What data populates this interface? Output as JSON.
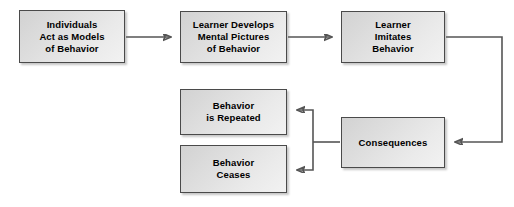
{
  "diagram": {
    "type": "flowchart",
    "background_color": "#ffffff",
    "box_fill_color": "#e2e2e2",
    "box_border_color": "#4a4a4a",
    "connector_color": "#555555",
    "text_color": "#000000",
    "nodes": [
      {
        "id": "individuals-act-as-models",
        "label": "Individuals\nAct as Models\nof Behavior",
        "x": 19,
        "y": 10,
        "w": 106,
        "h": 53
      },
      {
        "id": "learner-develops-mental-pictures",
        "label": "Learner Develops\nMental Pictures\nof Behavior",
        "x": 180,
        "y": 11,
        "w": 107,
        "h": 52
      },
      {
        "id": "learner-imitates-behavior",
        "label": "Learner\nImitates\nBehavior",
        "x": 341,
        "y": 11,
        "w": 104,
        "h": 52
      },
      {
        "id": "consequences",
        "label": "Consequences",
        "x": 341,
        "y": 117,
        "w": 104,
        "h": 51
      },
      {
        "id": "behavior-is-repeated",
        "label": "Behavior\nis Repeated",
        "x": 180,
        "y": 89,
        "w": 107,
        "h": 46
      },
      {
        "id": "behavior-ceases",
        "label": "Behavior\nCeases",
        "x": 180,
        "y": 145,
        "w": 107,
        "h": 48
      }
    ],
    "connectors": [
      {
        "id": "models-to-pictures",
        "from": "individuals-act-as-models",
        "to": "learner-develops-mental-pictures",
        "arrowhead": "right"
      },
      {
        "id": "pictures-to-imitates",
        "from": "learner-develops-mental-pictures",
        "to": "learner-imitates-behavior",
        "arrowhead": "right"
      },
      {
        "id": "imitates-to-consequences",
        "from": "learner-imitates-behavior",
        "to": "consequences",
        "arrowhead": "left"
      },
      {
        "id": "consequences-to-repeated",
        "from": "consequences",
        "to": "behavior-is-repeated",
        "arrowhead": "left"
      },
      {
        "id": "consequences-to-ceases",
        "from": "consequences",
        "to": "behavior-ceases",
        "arrowhead": "left"
      }
    ]
  }
}
